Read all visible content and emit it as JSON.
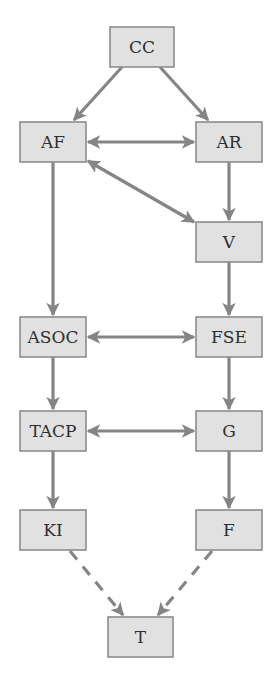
{
  "diagram": {
    "type": "flow-diagram",
    "colors": {
      "background": "#ffffff",
      "node_fill": "#e1e1e1",
      "node_border": "#8c8c8c",
      "edge": "#858585",
      "text": "#2e2e2e"
    },
    "nodes": [
      {
        "id": "CC",
        "label": "CC",
        "x": 110,
        "y": 27,
        "w": 64,
        "h": 40
      },
      {
        "id": "AF",
        "label": "AF",
        "x": 20,
        "y": 122,
        "w": 66,
        "h": 40
      },
      {
        "id": "AR",
        "label": "AR",
        "x": 196,
        "y": 122,
        "w": 66,
        "h": 40
      },
      {
        "id": "V",
        "label": "V",
        "x": 196,
        "y": 222,
        "w": 66,
        "h": 40
      },
      {
        "id": "ASOC",
        "label": "ASOC",
        "x": 20,
        "y": 317,
        "w": 66,
        "h": 40
      },
      {
        "id": "FSE",
        "label": "FSE",
        "x": 196,
        "y": 317,
        "w": 66,
        "h": 40
      },
      {
        "id": "TACP",
        "label": "TACP",
        "x": 20,
        "y": 411,
        "w": 66,
        "h": 40
      },
      {
        "id": "G",
        "label": "G",
        "x": 196,
        "y": 411,
        "w": 66,
        "h": 40
      },
      {
        "id": "KI",
        "label": "KI",
        "x": 20,
        "y": 510,
        "w": 66,
        "h": 40
      },
      {
        "id": "F",
        "label": "F",
        "x": 196,
        "y": 510,
        "w": 66,
        "h": 40
      },
      {
        "id": "T",
        "label": "T",
        "x": 108,
        "y": 617,
        "w": 65,
        "h": 40
      }
    ],
    "edges": [
      {
        "from": "CC",
        "to": "AF",
        "style": "solid",
        "direction": "forward"
      },
      {
        "from": "CC",
        "to": "AR",
        "style": "solid",
        "direction": "forward"
      },
      {
        "from": "AF",
        "to": "AR",
        "style": "solid",
        "direction": "both"
      },
      {
        "from": "AF",
        "to": "V",
        "style": "solid",
        "direction": "both"
      },
      {
        "from": "AR",
        "to": "V",
        "style": "solid",
        "direction": "forward"
      },
      {
        "from": "AF",
        "to": "ASOC",
        "style": "solid",
        "direction": "forward"
      },
      {
        "from": "V",
        "to": "FSE",
        "style": "solid",
        "direction": "forward"
      },
      {
        "from": "ASOC",
        "to": "FSE",
        "style": "solid",
        "direction": "both"
      },
      {
        "from": "ASOC",
        "to": "TACP",
        "style": "solid",
        "direction": "forward"
      },
      {
        "from": "FSE",
        "to": "G",
        "style": "solid",
        "direction": "forward"
      },
      {
        "from": "TACP",
        "to": "G",
        "style": "solid",
        "direction": "both"
      },
      {
        "from": "TACP",
        "to": "KI",
        "style": "solid",
        "direction": "forward"
      },
      {
        "from": "G",
        "to": "F",
        "style": "solid",
        "direction": "forward"
      },
      {
        "from": "KI",
        "to": "T",
        "style": "dashed",
        "direction": "forward"
      },
      {
        "from": "F",
        "to": "T",
        "style": "dashed",
        "direction": "forward"
      }
    ]
  }
}
